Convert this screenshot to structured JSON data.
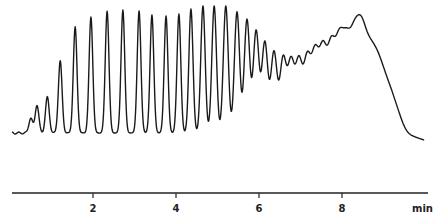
{
  "chart_data": {
    "type": "line",
    "title": "",
    "xlabel": "min",
    "ylabel": "",
    "xlim": [
      0.05,
      10.1
    ],
    "x_ticks": [
      2,
      4,
      6,
      8
    ],
    "x_tick_labels": [
      "2",
      "4",
      "6",
      "8"
    ],
    "grid": false,
    "legend": null,
    "baseline_signal": 0,
    "signal_scale_max": 127,
    "peaks": [
      {
        "t": 0.5,
        "height": 15
      },
      {
        "t": 0.65,
        "height": 28
      },
      {
        "t": 0.9,
        "height": 36
      },
      {
        "t": 1.21,
        "height": 72
      },
      {
        "t": 1.57,
        "height": 106
      },
      {
        "t": 1.95,
        "height": 116
      },
      {
        "t": 2.34,
        "height": 122
      },
      {
        "t": 2.72,
        "height": 123
      },
      {
        "t": 3.11,
        "height": 122
      },
      {
        "t": 3.42,
        "height": 118
      },
      {
        "t": 3.76,
        "height": 117
      },
      {
        "t": 4.07,
        "height": 119
      },
      {
        "t": 4.36,
        "height": 124
      },
      {
        "t": 4.65,
        "height": 127
      },
      {
        "t": 4.92,
        "height": 127
      },
      {
        "t": 5.2,
        "height": 127
      },
      {
        "t": 5.47,
        "height": 121
      },
      {
        "t": 5.71,
        "height": 113
      },
      {
        "t": 5.93,
        "height": 101
      },
      {
        "t": 6.14,
        "height": 89
      },
      {
        "t": 6.36,
        "height": 78
      },
      {
        "t": 6.58,
        "height": 69
      },
      {
        "t": 6.77,
        "height": 63
      },
      {
        "t": 6.96,
        "height": 61
      },
      {
        "t": 7.16,
        "height": 60
      },
      {
        "t": 7.35,
        "height": 61
      },
      {
        "t": 7.54,
        "height": 62
      },
      {
        "t": 7.74,
        "height": 62
      },
      {
        "t": 7.93,
        "height": 62
      },
      {
        "t": 8.1,
        "height": 58
      },
      {
        "t": 8.27,
        "height": 56
      },
      {
        "t": 8.41,
        "height": 53
      },
      {
        "t": 8.53,
        "height": 48
      },
      {
        "t": 8.67,
        "height": 42
      },
      {
        "t": 8.8,
        "height": 36
      },
      {
        "t": 8.92,
        "height": 30
      },
      {
        "t": 9.04,
        "height": 23
      },
      {
        "t": 9.16,
        "height": 18
      },
      {
        "t": 9.28,
        "height": 12
      },
      {
        "t": 9.4,
        "height": 7
      }
    ],
    "hump": {
      "center_t": 8.0,
      "height": 24,
      "width_t": 1.1
    },
    "trace_end": {
      "t": 9.98,
      "signal": -8
    }
  }
}
